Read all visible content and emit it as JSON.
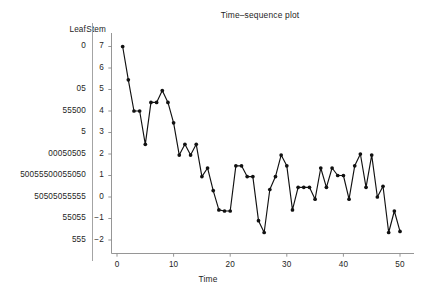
{
  "chart_data": {
    "type": "line",
    "title": "Time–sequence plot",
    "xlabel": "Time",
    "ylabel": "",
    "xlim": [
      0,
      51
    ],
    "ylim": [
      -2.6,
      7.6
    ],
    "grid": false,
    "legend": null,
    "marker": "filled-circle",
    "x": [
      1,
      2,
      3,
      4,
      5,
      6,
      7,
      8,
      9,
      10,
      11,
      12,
      13,
      14,
      15,
      16,
      17,
      18,
      19,
      20,
      21,
      22,
      23,
      24,
      25,
      26,
      27,
      28,
      29,
      30,
      31,
      32,
      33,
      34,
      35,
      36,
      37,
      38,
      39,
      40,
      41,
      42,
      43,
      44,
      45,
      46,
      47,
      48,
      49,
      50
    ],
    "values": [
      7.0,
      5.45,
      4.0,
      4.0,
      2.45,
      4.4,
      4.4,
      4.95,
      4.4,
      3.45,
      1.95,
      2.45,
      1.95,
      2.45,
      0.95,
      1.35,
      0.3,
      -0.6,
      -0.65,
      -0.65,
      1.45,
      1.45,
      0.95,
      0.95,
      -1.1,
      -1.65,
      0.35,
      0.95,
      1.95,
      1.45,
      -0.6,
      0.45,
      0.45,
      0.45,
      -0.1,
      1.35,
      0.45,
      1.35,
      1.0,
      1.0,
      -0.1,
      1.45,
      2.0,
      0.45,
      1.95,
      0.0,
      0.5,
      -1.65,
      -0.65,
      -1.6
    ],
    "xticks": [
      0,
      10,
      20,
      30,
      40,
      50
    ],
    "xticklabels": [
      "0",
      "10",
      "20",
      "30",
      "40",
      "50"
    ],
    "yticks": [
      7,
      6,
      5,
      4,
      3,
      2,
      1,
      0,
      -1,
      -2
    ],
    "yticklabels": [
      "7",
      "6",
      "5",
      "4",
      "3",
      "2",
      "1",
      "0",
      "−1",
      "−2"
    ],
    "line_color": "#111111",
    "marker_color": "#111111"
  },
  "stemleaf": {
    "leaf_header": "Leaf",
    "stem_header": "Stem",
    "rows": [
      {
        "stem": "7",
        "leaf": "0"
      },
      {
        "stem": "6",
        "leaf": ""
      },
      {
        "stem": "5",
        "leaf": "05"
      },
      {
        "stem": "4",
        "leaf": "55500"
      },
      {
        "stem": "3",
        "leaf": "5"
      },
      {
        "stem": "2",
        "leaf": "00050505"
      },
      {
        "stem": "1",
        "leaf": "50055500055050"
      },
      {
        "stem": "0",
        "leaf": "50505055555"
      },
      {
        "stem": "−1",
        "leaf": "55055"
      },
      {
        "stem": "−2",
        "leaf": "555"
      }
    ]
  },
  "colors": {
    "ink": "#1d1d1d",
    "axis": "#8a8a8a",
    "divider": "#9a9a9a",
    "series": "#111111",
    "background": "#ffffff"
  }
}
